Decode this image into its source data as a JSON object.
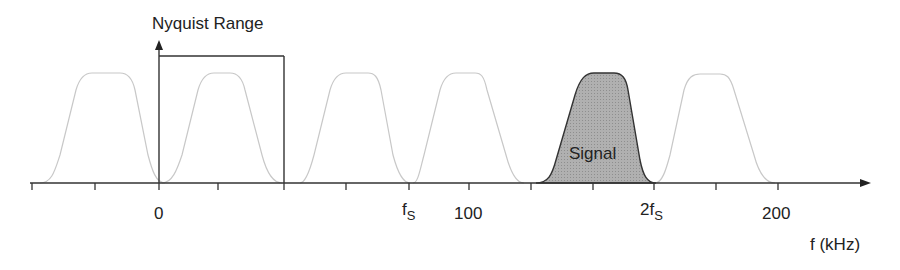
{
  "title": "Nyquist Range",
  "signal_label": "Signal",
  "axis_label": "f (kHz)",
  "tick_labels": [
    {
      "text": "0",
      "x": 159
    },
    {
      "text": "f",
      "sub": "S",
      "x": 409
    },
    {
      "text": "100",
      "x": 469
    },
    {
      "text": "2f",
      "sub": "S",
      "x": 654
    },
    {
      "text": "200",
      "x": 778
    }
  ],
  "colors": {
    "axis": "#333333",
    "image_lobe": "#c8c8c8",
    "signal_fill": "#a9a9a9",
    "signal_stroke": "#333333"
  },
  "lobes": [
    {
      "center": 95,
      "type": "image"
    },
    {
      "center": 222,
      "type": "image"
    },
    {
      "center": 346,
      "type": "image"
    },
    {
      "center": 469,
      "type": "image"
    },
    {
      "center": 593,
      "type": "signal"
    },
    {
      "center": 716,
      "type": "image"
    }
  ]
}
